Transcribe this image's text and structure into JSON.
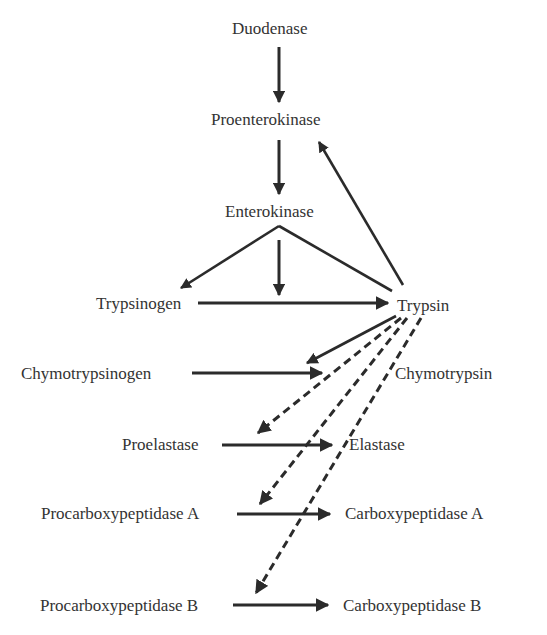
{
  "diagram": {
    "type": "enzyme-activation-cascade",
    "colors": {
      "text": "#333333",
      "arrow": "#2b2b2b",
      "background": "#ffffff"
    },
    "nodes": {
      "duodenase": "Duodenase",
      "proenterokinase": "Proenterokinase",
      "enterokinase": "Enterokinase",
      "trypsinogen": "Trypsinogen",
      "trypsin": "Trypsin",
      "chymotrypsinogen": "Chymotrypsinogen",
      "chymotrypsin": "Chymotrypsin",
      "proelastase": "Proelastase",
      "elastase": "Elastase",
      "procarboxypeptidase_a": "Procarboxypeptidase A",
      "carboxypeptidase_a": "Carboxypeptidase A",
      "procarboxypeptidase_b": "Procarboxypeptidase B",
      "carboxypeptidase_b": "Carboxypeptidase B"
    },
    "edges": [
      {
        "from": "Duodenase",
        "to": "Proenterokinase",
        "style": "solid"
      },
      {
        "from": "Proenterokinase",
        "to": "Enterokinase",
        "style": "solid"
      },
      {
        "from": "Enterokinase",
        "to": "Trypsinogen",
        "style": "solid"
      },
      {
        "from": "Enterokinase",
        "to": "Trypsinogen→Trypsin",
        "style": "solid"
      },
      {
        "from": "Trypsin",
        "to": "Enterokinase",
        "style": "solid-line"
      },
      {
        "from": "Trypsin",
        "to": "Proenterokinase",
        "style": "solid"
      },
      {
        "from": "Trypsinogen",
        "to": "Trypsin",
        "style": "solid"
      },
      {
        "from": "Trypsin",
        "to": "Chymotrypsinogen→Chymotrypsin",
        "style": "solid"
      },
      {
        "from": "Chymotrypsinogen",
        "to": "Chymotrypsin",
        "style": "solid"
      },
      {
        "from": "Trypsin",
        "to": "Proelastase",
        "style": "dashed"
      },
      {
        "from": "Proelastase",
        "to": "Elastase",
        "style": "solid"
      },
      {
        "from": "Trypsin",
        "to": "Procarboxypeptidase A",
        "style": "dashed"
      },
      {
        "from": "Procarboxypeptidase A",
        "to": "Carboxypeptidase A",
        "style": "solid"
      },
      {
        "from": "Trypsin",
        "to": "Procarboxypeptidase B",
        "style": "dashed"
      },
      {
        "from": "Procarboxypeptidase B",
        "to": "Carboxypeptidase B",
        "style": "solid"
      }
    ]
  }
}
